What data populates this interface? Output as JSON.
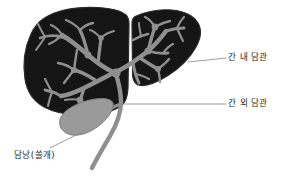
{
  "figure": {
    "background_color": "#ffffff",
    "labels": {
      "intrahepatic_duct": "간 내 담관",
      "extrahepatic_duct": "간 외 담관",
      "gallbladder": "담낭(쓸개)"
    },
    "colors": {
      "liver_fill": "#151515",
      "liver_edge": "#2c2c2c",
      "duct_fill": "#8f8f8f",
      "gallbladder_fill": "#9a9a9a",
      "gallbladder_edge": "#7d7d7d",
      "leader_line": "#8a8a8a",
      "text": "#1d1d1d"
    },
    "parts": [
      {
        "name": "liver-left-lobe",
        "description": "large dark lobe on the left"
      },
      {
        "name": "liver-right-lobe",
        "description": "smaller dark lobe on the right"
      },
      {
        "name": "intrahepatic-bile-duct-tree",
        "description": "gray branching duct network inside both lobes"
      },
      {
        "name": "gallbladder",
        "description": "pear-shaped gray sac below the left lobe"
      },
      {
        "name": "extrahepatic-bile-duct",
        "description": "gray duct curving down from the liver hilum"
      }
    ],
    "leader_lines": [
      {
        "name": "leader-intrahepatic",
        "from": [
          188,
          62
        ],
        "to": [
          226,
          58
        ]
      },
      {
        "name": "leader-extrahepatic",
        "from": [
          121,
          104
        ],
        "to": [
          226,
          104
        ]
      },
      {
        "name": "leader-gallbladder",
        "from": [
          84,
          131
        ],
        "to": [
          50,
          148
        ]
      }
    ]
  }
}
